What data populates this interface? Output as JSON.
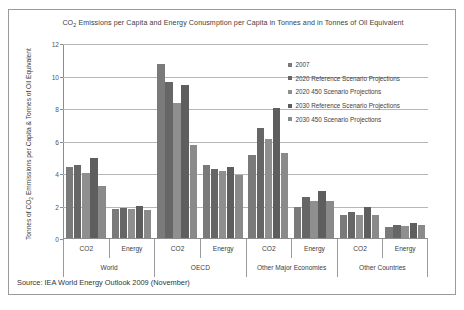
{
  "chart_data": {
    "type": "bar",
    "title": "CO2 Emissions per Capita and Energy Conusmption per Capita in Tonnes and in Tonnes of Oil Equivalent",
    "title_parts": {
      "pre": "CO",
      "sub": "2",
      "post": " Emissions per Capita and Energy Conusmption per Capita in Tonnes and in Tonnes of Oil Equivalent"
    },
    "ylabel": "Tonnes of CO2 Emmissions per Capita & Tonnes of Oil Equivalent",
    "ylabel_parts": {
      "pre": "Tonnes of CO",
      "sub": "2",
      "post": " Emmissions per Capita & Tonnes of Oil Equivalent"
    },
    "xlabel": "",
    "ylim": [
      0,
      12
    ],
    "yticks": [
      0,
      2,
      4,
      6,
      8,
      10,
      12
    ],
    "ytick_labels": [
      "0",
      "2",
      "4",
      "6",
      "8",
      "10",
      "12"
    ],
    "grid": true,
    "legend_position": "upper-right",
    "groups": [
      "World",
      "OECD",
      "Other Major Economies",
      "Other Countries"
    ],
    "subcategories": [
      "CO2",
      "Energy"
    ],
    "categories": [
      "World / CO2",
      "World / Energy",
      "OECD / CO2",
      "OECD / Energy",
      "Other Major Economies / CO2",
      "Other Major Economies / Energy",
      "Other Countries / CO2",
      "Other Countries / Energy"
    ],
    "series": [
      {
        "name": "2007",
        "color": "#7a7a7a",
        "values": [
          4.4,
          1.8,
          10.7,
          4.5,
          5.1,
          1.9,
          1.4,
          0.7
        ]
      },
      {
        "name": "2020 Reference Scenario Projections",
        "color": "#666666",
        "values": [
          4.5,
          1.85,
          9.6,
          4.25,
          6.8,
          2.5,
          1.6,
          0.8
        ]
      },
      {
        "name": "2020 450 Scenario Projections",
        "color": "#8f8f8f",
        "values": [
          4.0,
          1.8,
          8.3,
          4.1,
          6.1,
          2.3,
          1.4,
          0.75
        ]
      },
      {
        "name": "2030 Reference Scenario Projections",
        "color": "#5e5e5e",
        "values": [
          4.9,
          2.0,
          9.4,
          4.4,
          8.0,
          2.9,
          1.9,
          0.9
        ]
      },
      {
        "name": "2030 450 Scenario Projections",
        "color": "#8a8a8a",
        "values": [
          3.2,
          1.7,
          5.7,
          3.9,
          5.25,
          2.3,
          1.4,
          0.8
        ]
      }
    ]
  },
  "source": {
    "text": "Source: IEA World Energy Outlook 2009 (November)"
  },
  "colors": {
    "frame": "#9a9a9a",
    "gridline": "#b6b6b6",
    "axis": "#8c8c8c",
    "text": "#3d3d3d",
    "background": "#ffffff"
  }
}
